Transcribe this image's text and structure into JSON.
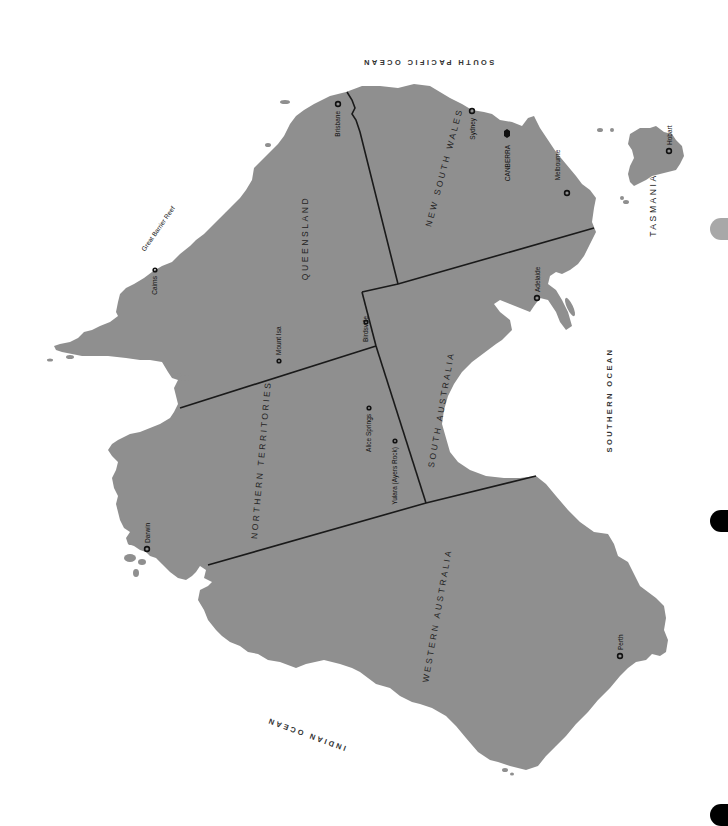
{
  "map": {
    "title": "Australia",
    "land_color": "#8f8f8f",
    "border_color": "#1a1a1a",
    "oceans": [
      {
        "id": "south-pacific",
        "label": "SOUTH PACIFIC OCEAN"
      },
      {
        "id": "southern",
        "label": "SOUTHERN OCEAN"
      },
      {
        "id": "indian",
        "label": "INDIAN OCEAN"
      }
    ],
    "states": [
      {
        "id": "queensland",
        "label": "QUEENSLAND"
      },
      {
        "id": "new-south-wales",
        "label": "NEW SOUTH WALES"
      },
      {
        "id": "northern-territories",
        "label": "NORTHERN TERRITORIES"
      },
      {
        "id": "south-australia",
        "label": "SOUTH AUSTRALIA"
      },
      {
        "id": "western-australia",
        "label": "WESTERN AUSTRALIA"
      },
      {
        "id": "tasmania",
        "label": "TASMANIA"
      }
    ],
    "cities": [
      {
        "id": "brisbane",
        "label": "Brisbane",
        "type": "city"
      },
      {
        "id": "sydney",
        "label": "Sydney",
        "type": "city"
      },
      {
        "id": "canberra",
        "label": "CANBERRA",
        "type": "capital"
      },
      {
        "id": "melbourne",
        "label": "Melbourne",
        "type": "city"
      },
      {
        "id": "hobart",
        "label": "Hobart",
        "type": "city"
      },
      {
        "id": "adelaide",
        "label": "Adelaide",
        "type": "city"
      },
      {
        "id": "perth",
        "label": "Perth",
        "type": "city"
      },
      {
        "id": "darwin",
        "label": "Darwin",
        "type": "city"
      },
      {
        "id": "cairns",
        "label": "Cairns",
        "type": "town"
      },
      {
        "id": "mount-isa",
        "label": "Mount Isa",
        "type": "town"
      },
      {
        "id": "birdsville",
        "label": "Birdsville",
        "type": "town"
      },
      {
        "id": "alice-springs",
        "label": "Alice Springs",
        "type": "town"
      },
      {
        "id": "yulara",
        "label": "Yulara (Ayers Rock)",
        "type": "town"
      }
    ],
    "features": [
      {
        "id": "great-barrier-reef",
        "label": "Great Barrier Reef"
      }
    ]
  },
  "page_tabs": [
    {
      "id": "tab-1",
      "color": "#a8a8a8"
    },
    {
      "id": "tab-2",
      "color": "#000000"
    },
    {
      "id": "tab-3",
      "color": "#000000"
    }
  ]
}
